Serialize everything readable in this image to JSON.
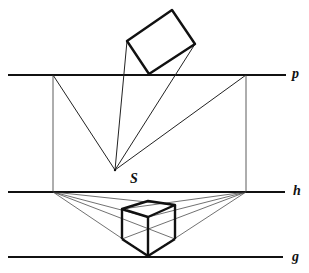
{
  "diagram": {
    "type": "perspective-construction",
    "labels": {
      "line_p": "p",
      "line_h": "h",
      "line_g": "g",
      "point_s": "S"
    },
    "colors": {
      "stroke": "#111111",
      "background": "#ffffff"
    }
  }
}
